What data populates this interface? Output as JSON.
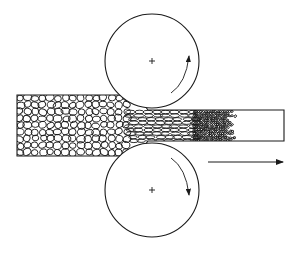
{
  "diagram": {
    "title": "",
    "type": "rolling-process-grain-structure",
    "stroke_color": "#1a1a1a",
    "background": "#ffffff",
    "rollers": [
      {
        "name": "top-roller",
        "cx": 152,
        "cy": 61,
        "r": 47,
        "rotation": "counterclockwise-up"
      },
      {
        "name": "bottom-roller",
        "cx": 152,
        "cy": 190,
        "r": 47,
        "rotation": "clockwise-down"
      }
    ],
    "strip_in": {
      "x": 17,
      "y_top": 95,
      "y_bottom": 156
    },
    "strip_out": {
      "x_end": 284,
      "y_top": 110,
      "y_bottom": 141
    },
    "direction_arrow": {
      "x1": 208,
      "x2": 287,
      "y": 162,
      "label": ""
    },
    "zones": [
      {
        "name": "coarse-grains",
        "x_start": 18,
        "x_end": 130
      },
      {
        "name": "elongated-grains",
        "x_start": 130,
        "x_end": 195
      },
      {
        "name": "recrystallized-fine-grains",
        "x_start": 195,
        "x_end": 238
      },
      {
        "name": "plain-strip",
        "x_start": 238,
        "x_end": 284
      }
    ]
  }
}
